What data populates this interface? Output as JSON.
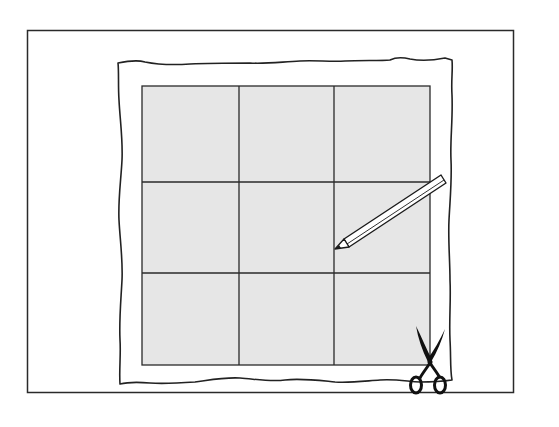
{
  "figure": {
    "colors": {
      "background": "#ffffff",
      "line": "#2a2a2a",
      "grid_fill": "#e6e6e6",
      "paper": "#ffffff"
    },
    "grid": {
      "rows": 3,
      "cols": 3
    },
    "icons": {
      "pencil": "pencil-icon",
      "scissors": "scissors-icon"
    }
  }
}
